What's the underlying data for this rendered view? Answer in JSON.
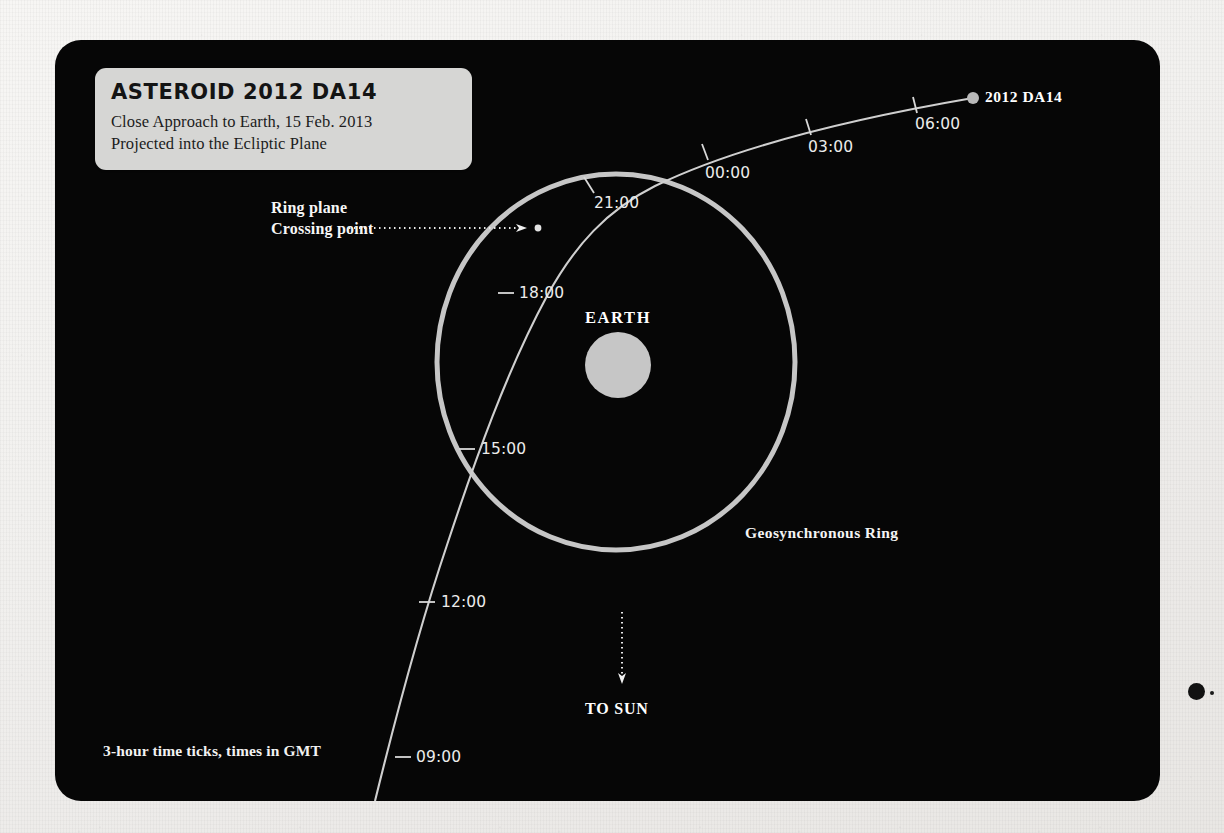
{
  "panel": {
    "background_color": "#060606",
    "page_background_color": "#f2f1ef"
  },
  "title_card": {
    "heading": "ASTEROID 2012 DA14",
    "subtitle_line_1": "Close Approach to Earth, 15 Feb. 2013",
    "subtitle_line_2": "Projected into the Ecliptic Plane",
    "background_color": "#d6d6d4"
  },
  "labels": {
    "earth": "EARTH",
    "ring": "Geosynchronous Ring",
    "asteroid": "2012 DA14",
    "crossing_line_1": "Ring plane",
    "crossing_line_2": "Crossing  point",
    "to_sun": "TO SUN",
    "footnote": "3-hour time ticks, times in GMT"
  },
  "chart_data": {
    "type": "scatter",
    "title": "ASTEROID 2012 DA14",
    "subtitle": "Close Approach to Earth, 15 Feb. 2013 — Projected into the Ecliptic Plane",
    "grid": false,
    "legend_position": "none",
    "annotations": [
      "EARTH",
      "Geosynchronous Ring",
      "2012 DA14",
      "Ring plane Crossing  point",
      "TO SUN",
      "3-hour time ticks, times in GMT"
    ],
    "earth": {
      "label": "EARTH",
      "x": 620,
      "y": 365,
      "radius": 33,
      "color": "#c8c8c8"
    },
    "geosynchronous_ring": {
      "label": "Geosynchronous Ring",
      "center_x": 616,
      "center_y": 362,
      "radius_x": 179,
      "radius_y": 188,
      "color": "#c6c6c6"
    },
    "sun_direction": {
      "label": "TO SUN",
      "from_y": 612,
      "to_y": 682,
      "x": 622
    },
    "trajectory": {
      "name": "2012 DA14",
      "color": "#cfcfcf",
      "tick_interval_hours": 3,
      "time_zone": "GMT",
      "endpoint_marker": {
        "label": "2012 DA14",
        "x": 973,
        "y": 98
      },
      "crossing_point": {
        "label": "Ring plane Crossing  point",
        "x": 538,
        "y": 228
      },
      "ticks": [
        {
          "time": "09:00",
          "x": 402,
          "y": 757,
          "label_dx": 14,
          "label_dy": -9
        },
        {
          "time": "12:00",
          "x": 427,
          "y": 602,
          "label_dx": 14,
          "label_dy": -9
        },
        {
          "time": "15:00",
          "x": 467,
          "y": 449,
          "label_dx": 14,
          "label_dy": -9
        },
        {
          "time": "18:00",
          "x": 505,
          "y": 293,
          "label_dx": 14,
          "label_dy": -9
        },
        {
          "time": "21:00",
          "x": 590,
          "y": 185,
          "label_dx": 4,
          "label_dy": 9
        },
        {
          "time": "00:00",
          "x": 705,
          "y": 152,
          "label_dx": 0,
          "label_dy": 12
        },
        {
          "time": "03:00",
          "x": 808,
          "y": 126,
          "label_dx": 0,
          "label_dy": 12
        },
        {
          "time": "06:00",
          "x": 915,
          "y": 103,
          "label_dx": 0,
          "label_dy": 12
        }
      ]
    }
  }
}
